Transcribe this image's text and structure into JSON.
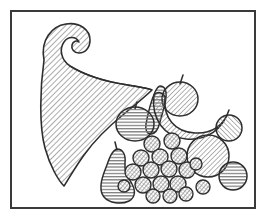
{
  "artwork": {
    "title": "Cornucopia with fruit",
    "subject": "cornucopia",
    "style": "black-and-white hatched line drawing",
    "caption": "",
    "canvas": {
      "width": 265,
      "height": 222,
      "background": "#ffffff"
    },
    "frame": {
      "name": "rectangular border",
      "x": 11,
      "y": 11,
      "width": 244,
      "height": 197,
      "stroke": "#3a3a3a",
      "stroke_width": 2,
      "fill": "none"
    },
    "palette": {
      "ink": "#3a3a3a",
      "outline": "#2e2e2e",
      "hatch": "#8c8c8c",
      "hatch_dark": "#6b6b6b",
      "paper": "#ffffff"
    },
    "elements": [
      {
        "id": "horn",
        "name": "cornucopia-horn",
        "label": "Cornucopia horn",
        "hatch": "diagonal-45",
        "hatch_color": "#8f8f8f",
        "outline": "#2e2e2e",
        "path": "M 44 60 C 40 40 52 26 66 24 C 80 22 90 30 90 40 C 90 48 85 53 79 53 C 74 53 71 49 72 45 C 73 41 77 40 79 42 C 76 36 68 36 64 42 C 59 49 61 60 70 66 C 86 76 108 82 128 85 C 140 87 148 88 152 90 C 146 96 136 104 124 114 C 108 127 94 141 84 155 C 74 169 68 180 64 186 C 58 180 50 166 45 148 C 39 126 40 88 44 60 Z"
      },
      {
        "id": "gourd",
        "name": "gourd-squash",
        "label": "Gourd",
        "hatch": "horizontal",
        "hatch_color": "#7d7d7d",
        "outline": "#2e2e2e",
        "path": "M 160 86 C 165 86 167 91 166 98 C 165 106 162 114 160 122 C 158 130 155 134 151 134 C 147 134 145 130 146 124 C 148 113 152 99 155 92 C 157 88 158 86 160 86 Z"
      },
      {
        "id": "apple",
        "name": "apple",
        "label": "Apple",
        "hatch": "diagonal-45",
        "hatch_color": "#8a8a8a",
        "outline": "#2e2e2e",
        "cx": 180,
        "cy": 98,
        "rx": 18,
        "ry": 17,
        "stem": {
          "x1": 180,
          "y1": 82,
          "x2": 183,
          "y2": 75
        }
      },
      {
        "id": "banana",
        "name": "banana",
        "label": "Banana",
        "hatch": "diagonal-45",
        "hatch_color": "#8a8a8a",
        "outline": "#2e2e2e",
        "path": "M 154 95 C 152 118 164 136 186 138 C 206 140 222 128 228 110 C 224 124 212 132 196 131 C 176 130 164 117 166 96 C 164 92 157 91 154 95 Z"
      },
      {
        "id": "orange-left",
        "name": "round-fruit-orange",
        "label": "Orange",
        "hatch": "horizontal",
        "hatch_color": "#7d7d7d",
        "outline": "#2e2e2e",
        "cx": 135,
        "cy": 123,
        "rx": 19,
        "ry": 17,
        "stem": {
          "x1": 135,
          "y1": 107,
          "x2": 137,
          "y2": 102
        }
      },
      {
        "id": "pear",
        "name": "pear",
        "label": "Pear",
        "hatch": "horizontal",
        "hatch_color": "#7d7d7d",
        "outline": "#2e2e2e",
        "path": "M 117 148 C 123 148 126 154 125 162 C 124 170 128 176 132 183 C 136 190 136 197 130 200 C 122 204 110 203 105 197 C 100 191 102 180 106 170 C 110 160 111 150 117 148 Z",
        "stem": {
          "x1": 117,
          "y1": 148,
          "x2": 115,
          "y2": 142
        }
      },
      {
        "id": "big-ball-1",
        "name": "large-round-fruit",
        "label": "Large round fruit",
        "hatch": "diagonal-45",
        "hatch_color": "#8a8a8a",
        "outline": "#2e2e2e",
        "cx": 208,
        "cy": 156,
        "r": 21
      },
      {
        "id": "ball-2",
        "name": "medium-round-fruit-upper-right",
        "label": "Medium round fruit",
        "hatch": "diagonal-135",
        "hatch_color": "#8a8a8a",
        "outline": "#2e2e2e",
        "cx": 229,
        "cy": 128,
        "r": 13
      },
      {
        "id": "ball-3",
        "name": "medium-round-fruit-lower-right",
        "label": "Medium round fruit",
        "hatch": "horizontal",
        "hatch_color": "#7d7d7d",
        "outline": "#2e2e2e",
        "cx": 233,
        "cy": 176,
        "r": 14
      },
      {
        "id": "ball-4",
        "name": "small-round-fruit-right-edge",
        "label": "Small round fruit",
        "hatch": "diagonal-45",
        "hatch_color": "#8a8a8a",
        "outline": "#2e2e2e",
        "cx": 203,
        "cy": 186,
        "r": 7
      }
    ],
    "grapes": {
      "name": "grape-cluster",
      "label": "Cluster of grapes",
      "hatch": "crosshatch",
      "hatch_color": "#6b6b6b",
      "outline": "#2e2e2e",
      "count": 17,
      "berries": [
        {
          "cx": 152,
          "cy": 144,
          "r": 8
        },
        {
          "cx": 172,
          "cy": 141,
          "r": 8
        },
        {
          "cx": 141,
          "cy": 158,
          "r": 8
        },
        {
          "cx": 160,
          "cy": 157,
          "r": 8
        },
        {
          "cx": 179,
          "cy": 156,
          "r": 8
        },
        {
          "cx": 133,
          "cy": 172,
          "r": 8
        },
        {
          "cx": 151,
          "cy": 170,
          "r": 8
        },
        {
          "cx": 169,
          "cy": 169,
          "r": 8
        },
        {
          "cx": 187,
          "cy": 170,
          "r": 8
        },
        {
          "cx": 143,
          "cy": 185,
          "r": 8
        },
        {
          "cx": 161,
          "cy": 184,
          "r": 8
        },
        {
          "cx": 178,
          "cy": 184,
          "r": 8
        },
        {
          "cx": 153,
          "cy": 196,
          "r": 7
        },
        {
          "cx": 170,
          "cy": 196,
          "r": 7
        },
        {
          "cx": 186,
          "cy": 194,
          "r": 7
        },
        {
          "cx": 196,
          "cy": 164,
          "r": 6
        },
        {
          "cx": 124,
          "cy": 186,
          "r": 6
        }
      ]
    }
  }
}
